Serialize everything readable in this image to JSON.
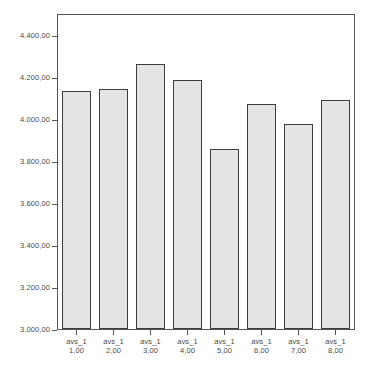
{
  "chart_data": {
    "type": "bar",
    "title": "",
    "subtitle": "",
    "xlabel": "",
    "ylabel": "",
    "categories": [
      "avs_1 1,00",
      "avs_1 2,00",
      "avs_1 3,00",
      "avs_1 4,00",
      "avs_1 5,00",
      "avs_1 6,00",
      "avs_1 7,00",
      "avs_1 8,00"
    ],
    "category_lines": [
      {
        "line1": "avs_1",
        "line2": "1,00"
      },
      {
        "line1": "avs_1",
        "line2": "2,00"
      },
      {
        "line1": "avs_1",
        "line2": "3,00"
      },
      {
        "line1": "avs_1",
        "line2": "4,00"
      },
      {
        "line1": "avs_1",
        "line2": "5,00"
      },
      {
        "line1": "avs_1",
        "line2": "6,00"
      },
      {
        "line1": "avs_1",
        "line2": "7,00"
      },
      {
        "line1": "avs_1",
        "line2": "8,00"
      }
    ],
    "values": [
      4135,
      4143,
      4263,
      4185,
      3855,
      4073,
      3978,
      4090
    ],
    "ylim": [
      3000,
      4500
    ],
    "yticks": [
      3000,
      3200,
      3400,
      3600,
      3800,
      4000,
      4200,
      4400
    ],
    "ytick_labels": [
      "3.000,00",
      "3.200,00",
      "3.400,00",
      "3.600,00",
      "3.800,00",
      "4.000,00",
      "4.200,00",
      "4.400,00"
    ],
    "grid": false,
    "legend": null,
    "legend_position": "none",
    "bar_fill_color": "#e4e4e4",
    "bar_border_color": "#3d3d3d",
    "axis_color": "#555555",
    "background_color": "#ffffff",
    "number_format": "european"
  }
}
